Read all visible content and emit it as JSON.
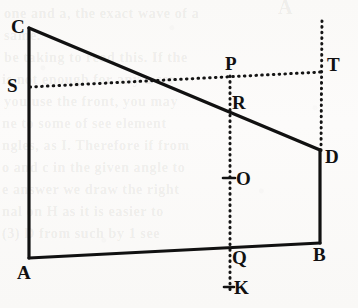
{
  "figure": {
    "background_color": "#fbfbfa",
    "ink_color": "#111111"
  },
  "ghost_text": {
    "lines": [
      {
        "text": "A",
        "x": 278,
        "y": -4,
        "size": 20
      },
      {
        "text": "one and a, the exact wave of a",
        "x": 4,
        "y": 6,
        "size": 14
      },
      {
        "text": "same.",
        "x": 4,
        "y": 28,
        "size": 14
      },
      {
        "text": "be taking to read this. If the",
        "x": 4,
        "y": 50,
        "size": 14
      },
      {
        "text": "is not enough for any a ser-",
        "x": 2,
        "y": 72,
        "size": 14
      },
      {
        "text": "you use the front, you may",
        "x": 4,
        "y": 94,
        "size": 14
      },
      {
        "text": "ne to some of see element",
        "x": 2,
        "y": 116,
        "size": 14
      },
      {
        "text": "ngles, as I. Therefore if from",
        "x": 2,
        "y": 138,
        "size": 14
      },
      {
        "text": "o and c in the given angle to",
        "x": 2,
        "y": 160,
        "size": 14
      },
      {
        "text": "e answer we draw the right",
        "x": 2,
        "y": 182,
        "size": 14
      },
      {
        "text": "nal on H as it is easier to",
        "x": 2,
        "y": 204,
        "size": 14
      },
      {
        "text": "(3) D from such by 1 see",
        "x": 2,
        "y": 226,
        "size": 14
      }
    ]
  },
  "labels": [
    {
      "name": "C",
      "text": "C",
      "x": 11,
      "y": 17
    },
    {
      "name": "S",
      "text": "S",
      "x": 7,
      "y": 76
    },
    {
      "name": "A",
      "text": "A",
      "x": 17,
      "y": 263
    },
    {
      "name": "P",
      "text": "P",
      "x": 225,
      "y": 54
    },
    {
      "name": "R",
      "text": "R",
      "x": 232,
      "y": 93
    },
    {
      "name": "O",
      "text": "O",
      "x": 236,
      "y": 169
    },
    {
      "name": "Q",
      "text": "Q",
      "x": 232,
      "y": 248
    },
    {
      "name": "K",
      "text": "K",
      "x": 234,
      "y": 278
    },
    {
      "name": "T",
      "text": "T",
      "x": 327,
      "y": 55
    },
    {
      "name": "D",
      "text": "D",
      "x": 325,
      "y": 147
    },
    {
      "name": "B",
      "text": "B",
      "x": 313,
      "y": 245
    }
  ],
  "vertices": {
    "A": {
      "x": 29,
      "y": 258
    },
    "B": {
      "x": 320,
      "y": 243
    },
    "C": {
      "x": 29,
      "y": 28
    },
    "D": {
      "x": 320,
      "y": 150
    },
    "S": {
      "x": 29,
      "y": 87
    },
    "P": {
      "x": 230,
      "y": 78
    },
    "R": {
      "x": 230,
      "y": 104
    },
    "O": {
      "x": 230,
      "y": 178
    },
    "Q": {
      "x": 230,
      "y": 247
    },
    "K": {
      "x": 230,
      "y": 288
    },
    "T": {
      "x": 322,
      "y": 72
    }
  },
  "solid_segments": [
    {
      "name": "segment-CA",
      "from": "C",
      "to": "A"
    },
    {
      "name": "segment-AB",
      "from": "A",
      "to": "B"
    },
    {
      "name": "segment-BD",
      "from": "B",
      "to": "D"
    },
    {
      "name": "segment-CD",
      "from": "C",
      "to": "D"
    }
  ],
  "dotted_segments": [
    {
      "name": "segment-ST",
      "from": "S",
      "to": "T",
      "desc": "horizontal dotted line S through P to T"
    },
    {
      "name": "segment-PK",
      "from": "P",
      "to": "K",
      "desc": "vertical dotted line P R O Q K"
    },
    {
      "name": "segment-T-vertical",
      "from": "T-top",
      "to": "D",
      "desc": "vertical dotted line above and below T down to D"
    }
  ],
  "tick_marks": [
    {
      "name": "tick-O",
      "x": 230,
      "y": 178
    },
    {
      "name": "tick-K",
      "x": 230,
      "y": 287
    }
  ]
}
